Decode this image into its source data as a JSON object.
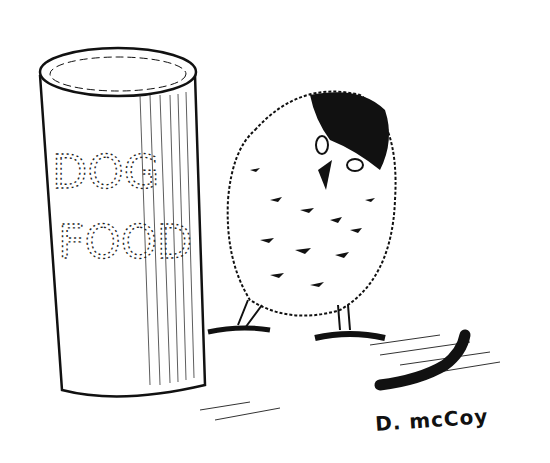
{
  "illustration": {
    "can": {
      "label_line1": "DOG",
      "label_line2": "FOOD"
    },
    "signature": "D. mcCoy",
    "colors": {
      "ink": "#111111",
      "paper": "#ffffff"
    }
  }
}
